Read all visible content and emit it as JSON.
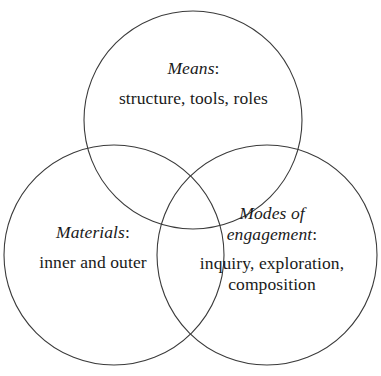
{
  "diagram": {
    "type": "venn-3-set",
    "background_color": "#ffffff",
    "stroke_color": "#3a3a3a",
    "text_color": "#1a1a1a",
    "sets": [
      {
        "id": "means",
        "position": "top",
        "heading": "Means",
        "heading_punctuation": ":",
        "items_text": "structure, tools, roles",
        "center_x": 193,
        "center_y": 120,
        "radius": 109
      },
      {
        "id": "materials",
        "position": "bottom-left",
        "heading": "Materials",
        "heading_punctuation": ":",
        "items_text": "inner and outer",
        "center_x": 114,
        "center_y": 255,
        "radius": 110
      },
      {
        "id": "modes-of-engagement",
        "position": "bottom-right",
        "heading": "Modes of engagement",
        "heading_punctuation": ":",
        "items_text": "inquiry, exploration, composition",
        "center_x": 267,
        "center_y": 255,
        "radius": 110
      }
    ]
  }
}
